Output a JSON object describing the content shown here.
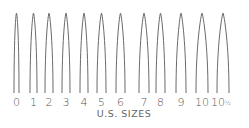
{
  "chart_data": {
    "type": "diagram",
    "title": "U.S. SIZES",
    "sizes": [
      {
        "label": "0",
        "width_rank": 0
      },
      {
        "label": "1",
        "width_rank": 1
      },
      {
        "label": "2",
        "width_rank": 2
      },
      {
        "label": "3",
        "width_rank": 3
      },
      {
        "label": "4",
        "width_rank": 4
      },
      {
        "label": "5",
        "width_rank": 5
      },
      {
        "label": "6",
        "width_rank": 6
      },
      {
        "label": "7",
        "width_rank": 7
      },
      {
        "label": "8",
        "width_rank": 8
      },
      {
        "label": "9",
        "width_rank": 9
      },
      {
        "label": "10",
        "width_rank": 10
      },
      {
        "label": "10",
        "half": "1/2",
        "width_rank": 11
      }
    ],
    "stroke_color": "#6a6a6a",
    "label_color": "#555555"
  }
}
